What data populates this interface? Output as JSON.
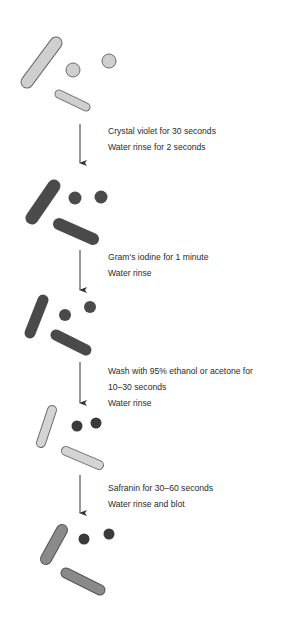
{
  "colors": {
    "unstained": "#cfcfcf",
    "crystal_violet": "#4a4a4a",
    "decolorized": "#d4d4d4",
    "safranin": "#8a8a8a",
    "outline": "#6a6a6a",
    "arrow": "#333333",
    "text": "#2a2a2a"
  },
  "steps": [
    {
      "lines": [
        "Crystal violet for 30 seconds",
        "Water rinse for 2 seconds"
      ]
    },
    {
      "lines": [
        "Gram's iodine for 1 minute",
        "Water rinse"
      ]
    },
    {
      "lines": [
        "Wash with 95% ethanol or acetone for",
        "10–30 seconds",
        "Water rinse"
      ]
    },
    {
      "lines": [
        "Safranin for 30–60 seconds",
        "Water rinse and blot"
      ]
    }
  ],
  "stages": [
    {
      "label": "unstained",
      "rods_color": "unstained",
      "cocci_color": "unstained"
    },
    {
      "label": "after crystal violet",
      "rods_color": "crystal_violet",
      "cocci_color": "crystal_violet"
    },
    {
      "label": "after iodine",
      "rods_color": "crystal_violet",
      "cocci_color": "crystal_violet"
    },
    {
      "label": "after decolorization",
      "rods_color": "decolorized",
      "cocci_color": "crystal_violet"
    },
    {
      "label": "after safranin",
      "rods_color": "safranin",
      "cocci_color": "crystal_violet"
    }
  ]
}
